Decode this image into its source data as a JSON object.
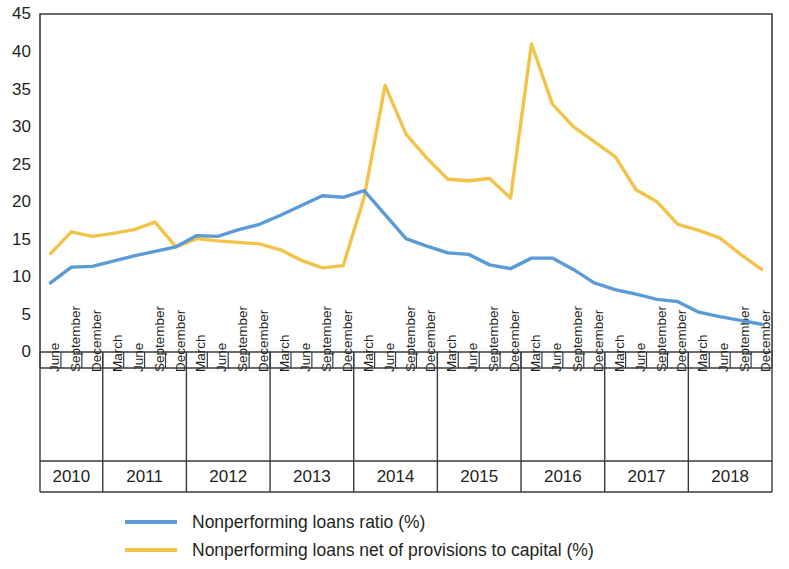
{
  "chart_data": {
    "type": "line",
    "title": "",
    "subtitle": "",
    "xlabel": "",
    "ylabel": "",
    "ylim": [
      0,
      45
    ],
    "ytick_step": 5,
    "yticks": [
      "0",
      "5",
      "10",
      "15",
      "20",
      "25",
      "30",
      "35",
      "40",
      "45"
    ],
    "grid": false,
    "legend_position": "bottom",
    "x": [
      "June 2010",
      "September 2010",
      "December 2010",
      "March 2011",
      "June 2011",
      "September 2011",
      "December 2011",
      "March 2012",
      "June 2012",
      "September 2012",
      "December 2012",
      "March 2013",
      "June 2013",
      "September 2013",
      "December 2013",
      "March 2014",
      "June 2014",
      "September 2014",
      "December 2014",
      "March 2015",
      "June 2015",
      "September 2015",
      "December 2015",
      "March 2016",
      "June 2016",
      "September 2016",
      "December 2016",
      "March 2017",
      "June 2017",
      "September 2017",
      "December 2017",
      "March 2018",
      "June 2018",
      "September 2018",
      "December 2018"
    ],
    "x_groups": [
      {
        "year": "2010",
        "months": [
          "June",
          "September",
          "December"
        ]
      },
      {
        "year": "2011",
        "months": [
          "March",
          "June",
          "September",
          "December"
        ]
      },
      {
        "year": "2012",
        "months": [
          "March",
          "June",
          "September",
          "December"
        ]
      },
      {
        "year": "2013",
        "months": [
          "March",
          "June",
          "September",
          "December"
        ]
      },
      {
        "year": "2014",
        "months": [
          "March",
          "June",
          "September",
          "December"
        ]
      },
      {
        "year": "2015",
        "months": [
          "March",
          "June",
          "September",
          "December"
        ]
      },
      {
        "year": "2016",
        "months": [
          "March",
          "June",
          "September",
          "December"
        ]
      },
      {
        "year": "2017",
        "months": [
          "March",
          "June",
          "September",
          "December"
        ]
      },
      {
        "year": "2018",
        "months": [
          "March",
          "June",
          "September",
          "December"
        ]
      }
    ],
    "series": [
      {
        "name": "Nonperforming loans ratio (%)",
        "color": "#5B9BD5",
        "values": [
          9.2,
          11.3,
          11.4,
          12.1,
          12.8,
          13.4,
          14.0,
          15.5,
          15.4,
          16.3,
          17.0,
          18.2,
          19.5,
          20.8,
          20.6,
          21.5,
          18.3,
          15.1,
          14.1,
          13.2,
          13.0,
          11.6,
          11.1,
          12.5,
          12.5,
          11.0,
          9.2,
          8.3,
          7.7,
          7.0,
          6.7,
          5.3,
          4.7,
          4.2,
          3.7
        ]
      },
      {
        "name": "Nonperforming loans net of provisions to capital (%)",
        "color": "#F2C249",
        "values": [
          13.1,
          16.0,
          15.4,
          15.8,
          16.3,
          17.3,
          14.0,
          15.1,
          14.8,
          14.6,
          14.4,
          13.6,
          12.2,
          11.2,
          11.5,
          20.6,
          35.5,
          29.0,
          25.8,
          23.0,
          22.8,
          23.1,
          20.5,
          41.0,
          33.0,
          30.0,
          28.0,
          26.0,
          21.6,
          20.0,
          17.0,
          16.2,
          15.2,
          13.0,
          11.0
        ]
      }
    ],
    "legend": [
      {
        "label": "Nonperforming loans ratio (%)",
        "color": "#5B9BD5"
      },
      {
        "label": "Nonperforming loans net of provisions to capital (%)",
        "color": "#F2C249"
      }
    ]
  }
}
